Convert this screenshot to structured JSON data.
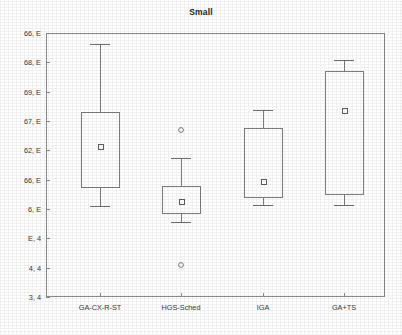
{
  "chart_data": {
    "type": "box",
    "title": "Small",
    "xlabel": "",
    "ylabel": "",
    "grid": false,
    "legend": false,
    "categories": [
      "GA-CX-R-ST",
      "HGS-Sched",
      "IGA",
      "GA+TS"
    ],
    "y_axis": {
      "note": "axis labels are degraded in the scanned source; transcribed as rendered",
      "tick_labels": [
        "6̃, E",
        "6̃, E",
        "6̃, E",
        "6̃, E",
        "6̃, E",
        "6̃, E",
        "6, E",
        "E, 4",
        "4, 4",
        "3, 4"
      ],
      "tick_labels_plain": [
        "66, E",
        "68, E",
        "69, E",
        "67, E",
        "62, E",
        "66, E",
        "6, E",
        "E, 4",
        "4, 4",
        "3, 4"
      ],
      "tick_count": 10,
      "axis_min_px": 297,
      "axis_max_px": 33
    },
    "boxes": [
      {
        "name": "GA-CX-R-ST",
        "center_px": 100,
        "whisker_high_px": 44,
        "box_top_px": 112,
        "mean_px": 146,
        "box_bottom_px": 187,
        "whisker_low_px": 206,
        "outliers_px": []
      },
      {
        "name": "HGS-Sched",
        "center_px": 181,
        "whisker_high_px": 158,
        "box_top_px": 186,
        "mean_px": 201,
        "box_bottom_px": 213,
        "whisker_low_px": 222,
        "outliers_px": [
          130,
          265
        ]
      },
      {
        "name": "IGA",
        "center_px": 263,
        "whisker_high_px": 110,
        "box_top_px": 128,
        "mean_px": 181,
        "box_bottom_px": 197,
        "whisker_low_px": 205,
        "outliers_px": []
      },
      {
        "name": "GA+TS",
        "center_px": 344,
        "whisker_high_px": 60,
        "box_top_px": 71,
        "mean_px": 110,
        "box_bottom_px": 194,
        "whisker_low_px": 205,
        "outliers_px": []
      }
    ],
    "marker_legend": {
      "mean_symbol": "open square",
      "outlier_symbol": "open circle"
    }
  },
  "colors": {
    "background": "#ffffff",
    "frame": "#8a8a8a",
    "box_stroke": "#7d7d7d",
    "whisker": "#6e6e6e",
    "marker": "#5e5e5e",
    "text": "#2b2b2b"
  },
  "plot_area": {
    "left_px": 46,
    "right_px": 385,
    "top_px": 33,
    "bottom_px": 297
  }
}
